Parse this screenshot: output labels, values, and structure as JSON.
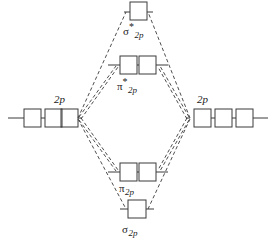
{
  "diagram": {
    "type": "molecular-orbital-correlation-diagram",
    "stroke_color": "#3a3a3a",
    "text_color": "#1a1a1a",
    "background": "#ffffff"
  },
  "atomic_orbitals": {
    "left": {
      "label_greek": "2",
      "label_italic": "p",
      "label_full": "2p",
      "box_count": 3,
      "electrons": 0
    },
    "right": {
      "label_greek": "2",
      "label_italic": "p",
      "label_full": "2p",
      "box_count": 3,
      "electrons": 0
    }
  },
  "molecular_orbitals": [
    {
      "id": "sigma-star-2p",
      "symbol": "σ",
      "star": "*",
      "subscript": "2p",
      "label_full": "σ*2p",
      "box_count": 1,
      "level": "antibonding",
      "order": 1
    },
    {
      "id": "pi-star-2p",
      "symbol": "π",
      "star": "*",
      "subscript": "2p",
      "label_full": "π*2p",
      "box_count": 2,
      "level": "antibonding",
      "order": 2
    },
    {
      "id": "pi-2p",
      "symbol": "π",
      "star": "",
      "subscript": "2p",
      "label_full": "π2p",
      "box_count": 2,
      "level": "bonding",
      "order": 3
    },
    {
      "id": "sigma-2p",
      "symbol": "σ",
      "star": "",
      "subscript": "2p",
      "label_full": "σ2p",
      "box_count": 1,
      "level": "bonding",
      "order": 4
    }
  ]
}
